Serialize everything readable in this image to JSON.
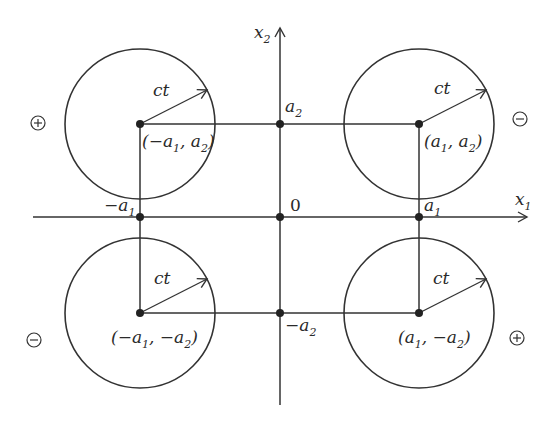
{
  "diagram": {
    "axes": {
      "x_label": "x",
      "x_label_sub": "1",
      "y_label": "x",
      "y_label_sub": "2",
      "origin_label": "0"
    },
    "ticks": {
      "neg_a1": {
        "pre": "−a",
        "sub": "1"
      },
      "a1": {
        "pre": "a",
        "sub": "1"
      },
      "a2": {
        "pre": "a",
        "sub": "2"
      },
      "neg_a2": {
        "pre": "−a",
        "sub": "2"
      }
    },
    "circles": [
      {
        "id": "top-left",
        "radius_label": "ct",
        "sign": "+",
        "coord": {
          "p1": "(−a",
          "s1": "1",
          "p2": ", a",
          "s2": "2",
          "p3": ")"
        }
      },
      {
        "id": "top-right",
        "radius_label": "ct",
        "sign": "−",
        "coord": {
          "p1": "(a",
          "s1": "1",
          "p2": ", a",
          "s2": "2",
          "p3": ")"
        }
      },
      {
        "id": "bottom-left",
        "radius_label": "ct",
        "sign": "−",
        "coord": {
          "p1": "(−a",
          "s1": "1",
          "p2": ", −a",
          "s2": "2",
          "p3": ")"
        }
      },
      {
        "id": "bottom-right",
        "radius_label": "ct",
        "sign": "+",
        "coord": {
          "p1": "(a",
          "s1": "1",
          "p2": ", −a",
          "s2": "2",
          "p3": ")"
        }
      }
    ],
    "colors": {
      "stroke": "#333333",
      "background": "#ffffff"
    }
  }
}
